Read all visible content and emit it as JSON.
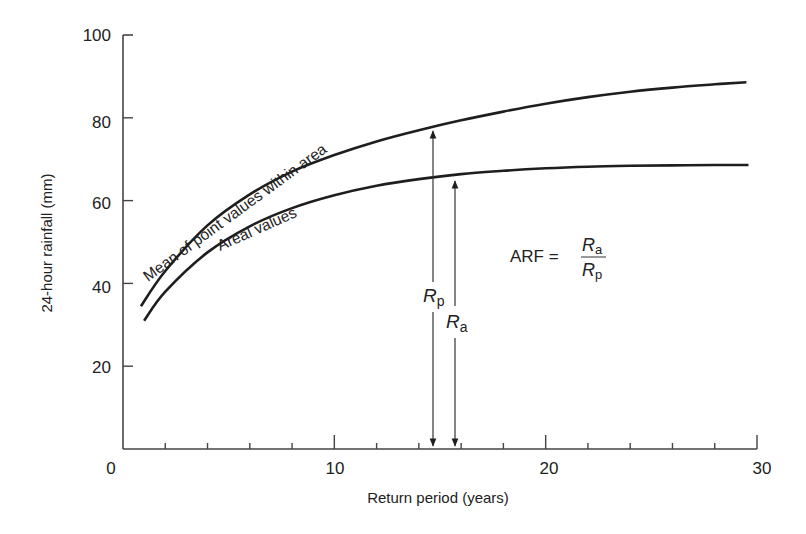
{
  "chart_data": {
    "type": "line",
    "title": "",
    "xlabel": "Return period (years)",
    "ylabel": "24-hour rainfall (mm)",
    "xlim": [
      0,
      30
    ],
    "ylim": [
      0,
      100
    ],
    "x_ticks": [
      "0",
      "10",
      "20",
      "30"
    ],
    "y_ticks": [
      "20",
      "40",
      "60",
      "80",
      "100"
    ],
    "x_minor_tick_step": 2,
    "grid": false,
    "legend": "inline labels along curves",
    "series": [
      {
        "name": "Mean of point values within area",
        "x": [
          0.85,
          2,
          4,
          6,
          8,
          10,
          12,
          14,
          16,
          18,
          20,
          22,
          24,
          26,
          28,
          29.5
        ],
        "values": [
          34.5,
          43,
          54,
          61.5,
          67,
          71,
          74.3,
          77,
          79.4,
          81.5,
          83.4,
          85,
          86.3,
          87.3,
          88.1,
          88.6
        ]
      },
      {
        "name": "Areal values",
        "x": [
          1.0,
          2,
          4,
          6,
          8,
          10,
          12,
          14,
          16,
          18,
          20,
          22,
          24,
          26,
          28,
          29.6
        ],
        "values": [
          31,
          38,
          47.5,
          53.8,
          58.2,
          61.3,
          63.6,
          65.2,
          66.4,
          67.2,
          67.8,
          68.2,
          68.4,
          68.5,
          68.6,
          68.6
        ]
      }
    ],
    "annotations": [
      {
        "type": "double-arrow",
        "label": "R_p",
        "x": 14.6,
        "y_from": 0,
        "y_to": 77.5
      },
      {
        "type": "double-arrow",
        "label": "R_a",
        "x": 15.7,
        "y_from": 0,
        "y_to": 65.5
      },
      {
        "type": "equation",
        "text": "ARF = R_a / R_p"
      }
    ]
  },
  "labels": {
    "y_title": "24-hour rainfall (mm)",
    "x_title": "Return period (years)",
    "x0": "0",
    "x10": "10",
    "x20": "20",
    "x30": "30",
    "y20": "20",
    "y40": "40",
    "y60": "60",
    "y80": "80",
    "y100": "100",
    "curve_mean": "Mean of point values within area",
    "curve_areal": "Areal values",
    "arf": "ARF =",
    "R": "R",
    "sub_a": "a",
    "sub_p": "p"
  },
  "colors": {
    "ink": "#1e1e1e",
    "axis": "#444444",
    "background": "#ffffff"
  }
}
